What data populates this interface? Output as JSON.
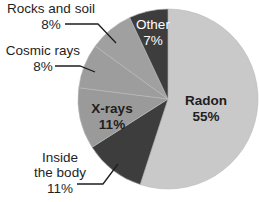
{
  "chart_data": {
    "type": "pie",
    "title": "",
    "start_angle_deg": 0,
    "direction": "clockwise",
    "slices": [
      {
        "label": "Radon",
        "value": 55,
        "display": "55%",
        "color": "#c9c9c9",
        "label_position": "inside"
      },
      {
        "label": "Inside the body",
        "value": 11,
        "display": "11%",
        "color": "#3d3d3d",
        "label_position": "outside",
        "label_lines": [
          "Inside",
          "the body"
        ]
      },
      {
        "label": "X-rays",
        "value": 11,
        "display": "11%",
        "color": "#9a9a9a",
        "label_position": "inside"
      },
      {
        "label": "Cosmic rays",
        "value": 8,
        "display": "8%",
        "color": "#9d9d9d",
        "label_position": "outside"
      },
      {
        "label": "Rocks and soil",
        "value": 8,
        "display": "8%",
        "color": "#a0a0a0",
        "label_position": "outside"
      },
      {
        "label": "Other",
        "value": 7,
        "display": "7%",
        "color": "#3d3d3d",
        "label_position": "inside"
      }
    ],
    "legend": "none",
    "units": "%"
  },
  "labels": {
    "radon": {
      "name": "Radon",
      "pct": "55%"
    },
    "inside": {
      "line1": "Inside",
      "line2": "the body",
      "pct": "11%"
    },
    "xrays": {
      "name": "X-rays",
      "pct": "11%"
    },
    "cosmic": {
      "name": "Cosmic rays",
      "pct": "8%"
    },
    "rocks": {
      "name": "Rocks and soil",
      "pct": "8%"
    },
    "other": {
      "name": "Other",
      "pct": "7%"
    }
  }
}
